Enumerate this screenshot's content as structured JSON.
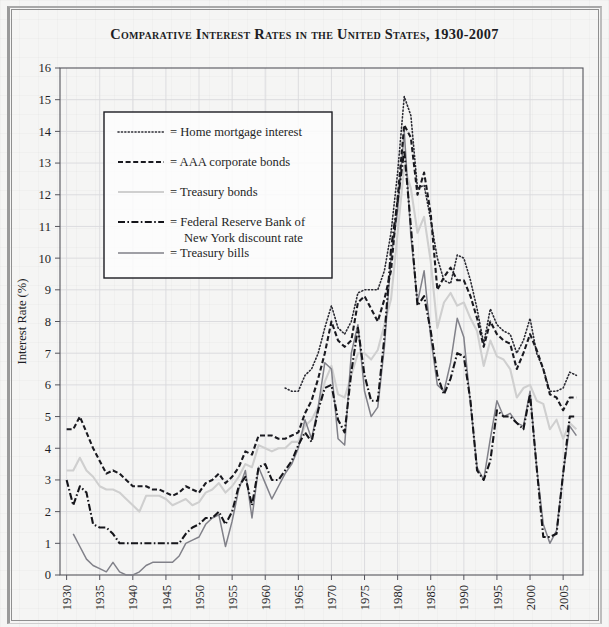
{
  "title": "Comparative Interest Rates in the United States, 1930-2007",
  "legend": {
    "items": [
      {
        "label": "= Home mortgage interest",
        "key": "home_mortgage",
        "style": "dotted"
      },
      {
        "label": "= AAA corporate bonds",
        "key": "aaa_corporate",
        "style": "dashed"
      },
      {
        "label": "= Treasury bonds",
        "key": "treasury_bonds",
        "style": "solid-light"
      },
      {
        "label": "= Federal Reserve Bank of",
        "label2": "New York discount rate",
        "key": "fed_discount",
        "style": "dash-dot"
      },
      {
        "label": "= Treasury bills",
        "key": "treasury_bills",
        "style": "solid-gray"
      }
    ]
  },
  "colors": {
    "ink": "#1f1f26",
    "home_mortgage": "#2b2b33",
    "aaa_corporate": "#1a1a20",
    "treasury_bonds": "#cfcfcf",
    "fed_discount": "#15151a",
    "treasury_bills": "#818189",
    "grid": "#d9d9dd",
    "frame": "#54545c",
    "background": "#f5f5f4"
  },
  "chart_data": {
    "type": "line",
    "title": "Comparative Interest Rates in the United States, 1930-2007",
    "xlabel": "",
    "ylabel": "Interest Rate (%)",
    "xlim": [
      1929,
      2008
    ],
    "ylim": [
      0,
      16
    ],
    "yticks": [
      0,
      1,
      2,
      3,
      4,
      5,
      6,
      7,
      8,
      9,
      10,
      11,
      12,
      13,
      14,
      15,
      16
    ],
    "xticks": [
      1930,
      1935,
      1940,
      1945,
      1950,
      1955,
      1960,
      1965,
      1970,
      1975,
      1980,
      1985,
      1990,
      1995,
      2000,
      2005
    ],
    "xtick_labels": [
      "1930",
      "1935",
      "1940",
      "1945",
      "1950",
      "1955",
      "1960",
      "1965",
      "1970",
      "1975",
      "1980",
      "1985",
      "1990",
      "1995",
      "2000",
      "2005"
    ],
    "ytick_labels": [
      "0",
      "1",
      "2",
      "3",
      "4",
      "5",
      "6",
      "7",
      "8",
      "9",
      "10",
      "11",
      "12",
      "13",
      "14",
      "15",
      "16"
    ],
    "grid": true,
    "legend_position": "upper-left-inside",
    "series": [
      {
        "name": "Home mortgage interest",
        "style": "dotted",
        "x": [
          1963,
          1964,
          1965,
          1966,
          1967,
          1968,
          1969,
          1970,
          1971,
          1972,
          1973,
          1974,
          1975,
          1976,
          1977,
          1978,
          1979,
          1980,
          1981,
          1982,
          1983,
          1984,
          1985,
          1986,
          1987,
          1988,
          1989,
          1990,
          1991,
          1992,
          1993,
          1994,
          1995,
          1996,
          1997,
          1998,
          1999,
          2000,
          2001,
          2002,
          2003,
          2004,
          2005,
          2006,
          2007
        ],
        "values": [
          5.9,
          5.8,
          5.8,
          6.3,
          6.5,
          7.0,
          7.8,
          8.5,
          7.8,
          7.6,
          8.0,
          8.9,
          9.0,
          9.0,
          9.0,
          9.6,
          10.8,
          12.7,
          15.1,
          14.5,
          12.2,
          12.3,
          11.2,
          10.0,
          9.3,
          9.2,
          10.1,
          10.0,
          9.3,
          8.4,
          7.3,
          8.4,
          7.9,
          7.7,
          7.6,
          7.0,
          7.4,
          8.1,
          7.0,
          6.5,
          5.8,
          5.8,
          5.9,
          6.4,
          6.3
        ]
      },
      {
        "name": "AAA corporate bonds",
        "style": "dashed",
        "x": [
          1930,
          1931,
          1932,
          1933,
          1934,
          1935,
          1936,
          1937,
          1938,
          1939,
          1940,
          1941,
          1942,
          1943,
          1944,
          1945,
          1946,
          1947,
          1948,
          1949,
          1950,
          1951,
          1952,
          1953,
          1954,
          1955,
          1956,
          1957,
          1958,
          1959,
          1960,
          1961,
          1962,
          1963,
          1964,
          1965,
          1966,
          1967,
          1968,
          1969,
          1970,
          1971,
          1972,
          1973,
          1974,
          1975,
          1976,
          1977,
          1978,
          1979,
          1980,
          1981,
          1982,
          1983,
          1984,
          1985,
          1986,
          1987,
          1988,
          1989,
          1990,
          1991,
          1992,
          1993,
          1994,
          1995,
          1996,
          1997,
          1998,
          1999,
          2000,
          2001,
          2002,
          2003,
          2004,
          2005,
          2006,
          2007
        ],
        "values": [
          4.6,
          4.6,
          5.0,
          4.5,
          4.0,
          3.6,
          3.2,
          3.3,
          3.2,
          3.0,
          2.8,
          2.8,
          2.8,
          2.7,
          2.7,
          2.6,
          2.5,
          2.6,
          2.8,
          2.7,
          2.6,
          2.9,
          3.0,
          3.2,
          2.9,
          3.1,
          3.4,
          3.9,
          3.8,
          4.4,
          4.4,
          4.4,
          4.3,
          4.3,
          4.4,
          4.5,
          5.1,
          5.5,
          6.2,
          7.0,
          8.0,
          7.4,
          7.2,
          7.4,
          8.6,
          8.8,
          8.4,
          8.0,
          8.7,
          9.6,
          11.9,
          14.2,
          13.8,
          12.0,
          12.7,
          11.4,
          9.0,
          9.4,
          9.7,
          9.3,
          9.3,
          8.8,
          8.1,
          7.2,
          8.0,
          7.6,
          7.4,
          7.3,
          6.5,
          7.0,
          7.6,
          7.1,
          6.5,
          5.7,
          5.6,
          5.2,
          5.6,
          5.6
        ]
      },
      {
        "name": "Treasury bonds",
        "style": "solid-light",
        "x": [
          1930,
          1931,
          1932,
          1933,
          1934,
          1935,
          1936,
          1937,
          1938,
          1939,
          1940,
          1941,
          1942,
          1943,
          1944,
          1945,
          1946,
          1947,
          1948,
          1949,
          1950,
          1951,
          1952,
          1953,
          1954,
          1955,
          1956,
          1957,
          1958,
          1959,
          1960,
          1961,
          1962,
          1963,
          1964,
          1965,
          1966,
          1967,
          1968,
          1969,
          1970,
          1971,
          1972,
          1973,
          1974,
          1975,
          1976,
          1977,
          1978,
          1979,
          1980,
          1981,
          1982,
          1983,
          1984,
          1985,
          1986,
          1987,
          1988,
          1989,
          1990,
          1991,
          1992,
          1993,
          1994,
          1995,
          1996,
          1997,
          1998,
          1999,
          2000,
          2001,
          2002,
          2003,
          2004,
          2005,
          2006,
          2007
        ],
        "values": [
          3.3,
          3.3,
          3.7,
          3.3,
          3.1,
          2.8,
          2.7,
          2.7,
          2.6,
          2.4,
          2.2,
          2.0,
          2.5,
          2.5,
          2.5,
          2.4,
          2.2,
          2.3,
          2.4,
          2.2,
          2.3,
          2.6,
          2.7,
          2.9,
          2.6,
          2.8,
          3.1,
          3.5,
          3.4,
          4.1,
          4.0,
          3.9,
          4.0,
          4.0,
          4.2,
          4.2,
          4.7,
          4.9,
          5.3,
          6.1,
          6.6,
          5.7,
          5.6,
          6.3,
          7.0,
          7.0,
          6.8,
          7.1,
          7.9,
          8.7,
          10.8,
          12.9,
          12.2,
          10.8,
          11.3,
          9.9,
          7.8,
          8.6,
          8.9,
          8.5,
          8.6,
          8.1,
          7.7,
          6.6,
          7.4,
          6.9,
          6.8,
          6.5,
          5.6,
          5.9,
          6.0,
          5.5,
          5.4,
          4.6,
          4.9,
          4.3,
          4.8,
          4.6
        ]
      },
      {
        "name": "Federal Reserve Bank of New York discount rate",
        "style": "dash-dot",
        "x": [
          1930,
          1931,
          1932,
          1933,
          1934,
          1935,
          1936,
          1937,
          1938,
          1939,
          1940,
          1941,
          1942,
          1943,
          1944,
          1945,
          1946,
          1947,
          1948,
          1949,
          1950,
          1951,
          1952,
          1953,
          1954,
          1955,
          1956,
          1957,
          1958,
          1959,
          1960,
          1961,
          1962,
          1963,
          1964,
          1965,
          1966,
          1967,
          1968,
          1969,
          1970,
          1971,
          1972,
          1973,
          1974,
          1975,
          1976,
          1977,
          1978,
          1979,
          1980,
          1981,
          1982,
          1983,
          1984,
          1985,
          1986,
          1987,
          1988,
          1989,
          1990,
          1991,
          1992,
          1993,
          1994,
          1995,
          1996,
          1997,
          1998,
          1999,
          2000,
          2001,
          2002,
          2003,
          2004,
          2005,
          2006,
          2007
        ],
        "values": [
          3.0,
          2.2,
          2.8,
          2.6,
          1.6,
          1.5,
          1.5,
          1.3,
          1.0,
          1.0,
          1.0,
          1.0,
          1.0,
          1.0,
          1.0,
          1.0,
          1.0,
          1.0,
          1.3,
          1.5,
          1.6,
          1.8,
          1.8,
          2.0,
          1.6,
          2.0,
          2.8,
          3.1,
          2.2,
          3.4,
          3.5,
          3.0,
          3.0,
          3.3,
          3.6,
          4.1,
          4.5,
          4.2,
          5.2,
          5.9,
          6.0,
          4.9,
          4.5,
          6.4,
          7.8,
          6.3,
          5.5,
          5.5,
          7.5,
          10.3,
          11.8,
          13.4,
          11.0,
          8.5,
          8.8,
          7.7,
          6.3,
          5.7,
          6.2,
          7.0,
          6.9,
          5.5,
          3.3,
          3.0,
          3.6,
          5.2,
          5.0,
          5.0,
          4.8,
          4.6,
          5.7,
          3.4,
          1.2,
          1.2,
          1.3,
          3.2,
          5.0,
          5.0
        ]
      },
      {
        "name": "Treasury bills",
        "style": "solid-gray",
        "x": [
          1931,
          1932,
          1933,
          1934,
          1935,
          1936,
          1937,
          1938,
          1939,
          1940,
          1941,
          1942,
          1943,
          1944,
          1945,
          1946,
          1947,
          1948,
          1949,
          1950,
          1951,
          1952,
          1953,
          1954,
          1955,
          1956,
          1957,
          1958,
          1959,
          1960,
          1961,
          1962,
          1963,
          1964,
          1965,
          1966,
          1967,
          1968,
          1969,
          1970,
          1971,
          1972,
          1973,
          1974,
          1975,
          1976,
          1977,
          1978,
          1979,
          1980,
          1981,
          1982,
          1983,
          1984,
          1985,
          1986,
          1987,
          1988,
          1989,
          1990,
          1991,
          1992,
          1993,
          1994,
          1995,
          1996,
          1997,
          1998,
          1999,
          2000,
          2001,
          2002,
          2003,
          2004,
          2005,
          2006,
          2007
        ],
        "values": [
          1.3,
          0.9,
          0.5,
          0.3,
          0.2,
          0.1,
          0.4,
          0.1,
          0.0,
          0.0,
          0.1,
          0.3,
          0.4,
          0.4,
          0.4,
          0.4,
          0.6,
          1.0,
          1.1,
          1.2,
          1.6,
          1.8,
          1.9,
          0.9,
          1.7,
          2.7,
          3.3,
          1.8,
          3.4,
          2.9,
          2.4,
          2.8,
          3.2,
          3.5,
          4.0,
          4.9,
          4.3,
          5.3,
          6.7,
          6.5,
          4.3,
          4.1,
          7.0,
          7.9,
          5.8,
          5.0,
          5.3,
          7.2,
          10.0,
          11.5,
          14.0,
          10.7,
          8.6,
          9.6,
          7.5,
          6.0,
          5.8,
          6.7,
          8.1,
          7.5,
          5.4,
          3.4,
          3.0,
          4.3,
          5.5,
          5.0,
          5.1,
          4.8,
          4.7,
          5.8,
          3.4,
          1.6,
          1.0,
          1.4,
          3.2,
          4.7,
          4.4
        ]
      }
    ]
  }
}
